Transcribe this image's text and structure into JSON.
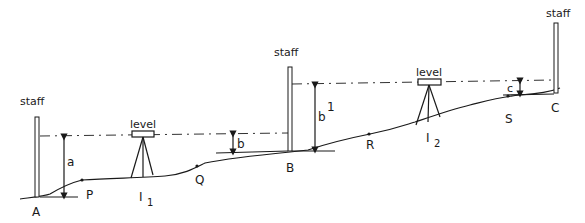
{
  "diagram": {
    "staff_labels": [
      "staff",
      "staff",
      "staff"
    ],
    "level_labels": [
      "level",
      "level"
    ],
    "points": {
      "A": "A",
      "P": "P",
      "Q": "Q",
      "B": "B",
      "R": "R",
      "S": "S",
      "C": "C"
    },
    "instrument_stations": [
      {
        "label": "I",
        "sub": "1"
      },
      {
        "label": "I",
        "sub": "2"
      }
    ],
    "measurements": {
      "a": "a",
      "b": "b",
      "b1": "b",
      "b1_sup": "1",
      "c": "c"
    },
    "colors": {
      "ink": "#1a1a1a",
      "background": "#ffffff"
    }
  }
}
